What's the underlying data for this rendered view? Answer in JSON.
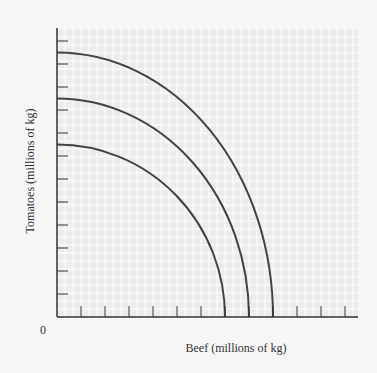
{
  "chart_data": {
    "type": "line",
    "title": "",
    "xlabel": "Beef (millions of kg)",
    "ylabel": "Tomatoes (millions of kg)",
    "origin_label": "0",
    "xlim": [
      0,
      12.5
    ],
    "ylim": [
      0,
      12.5
    ],
    "x_ticks": 12,
    "y_ticks": 12,
    "grid": true,
    "legend": null,
    "series": [
      {
        "name": "PPF 1 (inner)",
        "x_intercept": 7,
        "y_intercept": 7.5,
        "shape": "concave-quarter-ellipse"
      },
      {
        "name": "PPF 2 (middle)",
        "x_intercept": 8,
        "y_intercept": 9.5,
        "shape": "concave-quarter-ellipse"
      },
      {
        "name": "PPF 3 (outer)",
        "x_intercept": 9,
        "y_intercept": 11.5,
        "shape": "concave-quarter-ellipse"
      }
    ]
  },
  "colors": {
    "background": "#f7f7f7",
    "plot_area": "#ececec",
    "grid": "#f9f9f9",
    "axis": "#333333",
    "curve": "#444444"
  }
}
